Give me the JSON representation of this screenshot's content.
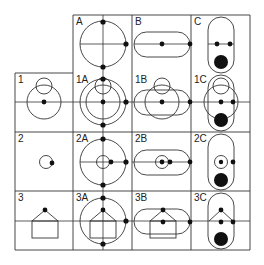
{
  "diagram": {
    "columns": [
      {
        "id": "A",
        "label": "A",
        "shape": "circle with cross axes"
      },
      {
        "id": "B",
        "label": "B",
        "shape": "horizontal stadium"
      },
      {
        "id": "C",
        "label": "C",
        "shape": "vertical stadium with filled disc"
      }
    ],
    "rows": [
      {
        "id": "1",
        "label": "1",
        "shape": "two circles"
      },
      {
        "id": "2",
        "label": "2",
        "shape": "small circle"
      },
      {
        "id": "3",
        "label": "3",
        "shape": "house"
      }
    ],
    "cells": {
      "A": "A",
      "B": "B",
      "C": "C",
      "1": "1",
      "1A": "1A",
      "1B": "1B",
      "1C": "1C",
      "2": "2",
      "2A": "2A",
      "2B": "2B",
      "2C": "2C",
      "3": "3",
      "3A": "3A",
      "3B": "3B",
      "3C": "3C"
    },
    "colors": {
      "line": "#333333",
      "dot": "#111111",
      "background": "#ffffff"
    }
  }
}
